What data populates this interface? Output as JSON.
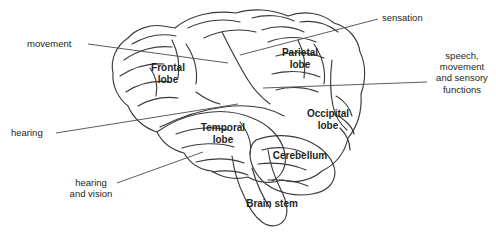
{
  "diagram": {
    "background_color": "#ffffff",
    "ink_color": "#231f20",
    "outline_color": "#3a3a3a"
  },
  "lobe_labels": [
    {
      "id": "frontal",
      "text": "Frontal\nlobe",
      "x": 142,
      "y": 62,
      "w": 52
    },
    {
      "id": "parietal",
      "text": "Parietal\nlobe",
      "x": 272,
      "y": 47,
      "w": 56
    },
    {
      "id": "occipital",
      "text": "Occipital\nlobe",
      "x": 300,
      "y": 108,
      "w": 56
    },
    {
      "id": "temporal",
      "text": "Temporal\nlobe",
      "x": 194,
      "y": 122,
      "w": 58
    },
    {
      "id": "cerebellum",
      "text": "Cerebellum",
      "x": 264,
      "y": 150,
      "w": 72
    },
    {
      "id": "brain-stem",
      "text": "Brain stem",
      "x": 238,
      "y": 198,
      "w": 68
    }
  ],
  "annotations": [
    {
      "id": "movement",
      "text": "movement",
      "x": 27,
      "y": 38,
      "w": 58,
      "align": "left"
    },
    {
      "id": "hearing",
      "text": "hearing",
      "x": 11,
      "y": 127,
      "w": 48,
      "align": "left"
    },
    {
      "id": "hearing-and-vision",
      "text": "hearing\nand vision",
      "x": 62,
      "y": 177,
      "w": 58,
      "align": "center"
    },
    {
      "id": "sensation",
      "text": "sensation",
      "x": 382,
      "y": 12,
      "w": 54,
      "align": "left"
    },
    {
      "id": "speech-movement",
      "text": "speech,\nmovement\nand sensory\nfunctions",
      "x": 430,
      "y": 50,
      "w": 64,
      "align": "center"
    }
  ],
  "leader_lines": [
    {
      "id": "leader-movement",
      "x1": 88,
      "y1": 44,
      "x2": 228,
      "y2": 63
    },
    {
      "id": "leader-hearing",
      "x1": 56,
      "y1": 133,
      "x2": 238,
      "y2": 104
    },
    {
      "id": "leader-hearing-vision",
      "x1": 117,
      "y1": 183,
      "x2": 203,
      "y2": 152
    },
    {
      "id": "leader-sensation",
      "x1": 378,
      "y1": 19,
      "x2": 240,
      "y2": 55
    },
    {
      "id": "leader-speech",
      "x1": 427,
      "y1": 82,
      "x2": 263,
      "y2": 88
    }
  ]
}
